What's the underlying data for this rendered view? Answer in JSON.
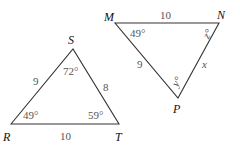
{
  "figure": {
    "triangle_rst": {
      "vertices": {
        "R": "R",
        "S": "S",
        "T": "T"
      },
      "sides": {
        "RS": "9",
        "ST": "8",
        "RT": "10"
      },
      "angles": {
        "R": "49°",
        "S": "72°",
        "T": "59°"
      }
    },
    "triangle_mnp": {
      "vertices": {
        "M": "M",
        "N": "N",
        "P": "P"
      },
      "sides": {
        "MN": "10",
        "MP": "9",
        "NP": "x"
      },
      "angles": {
        "M": "49°",
        "N": "z°",
        "P": "y°"
      }
    }
  }
}
